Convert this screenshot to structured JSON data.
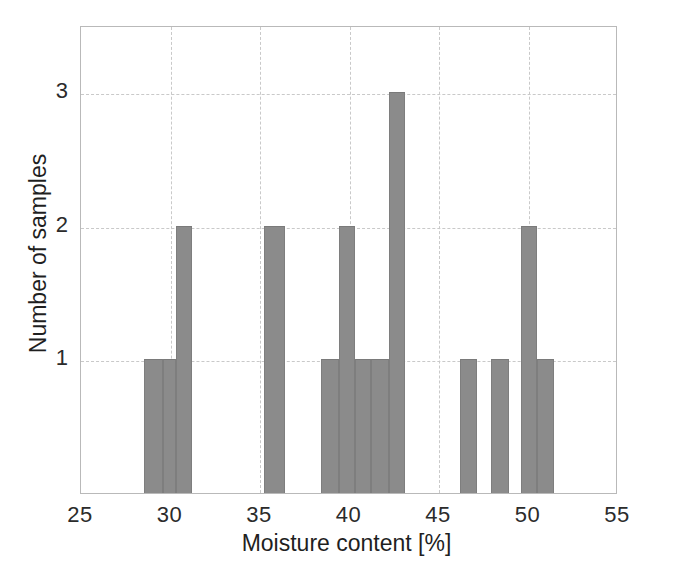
{
  "chart_data": {
    "type": "bar",
    "title": "",
    "subtitle": "",
    "xlabel": "Moisture content [%]",
    "ylabel": "Number of samples",
    "xlim": [
      25,
      55
    ],
    "ylim": [
      0,
      3.5
    ],
    "xticks": [
      25,
      30,
      35,
      40,
      45,
      50,
      55
    ],
    "xticklabels": [
      "25",
      "30",
      "35",
      "40",
      "45",
      "50",
      "55"
    ],
    "yticks": [
      1,
      2,
      3
    ],
    "yticklabels": [
      "1",
      "2",
      "3"
    ],
    "grid": "dashed-both-axes",
    "legend": "none",
    "bar_color": "#8b8b8b",
    "bin_width": 1.0,
    "bins": [
      {
        "x0": 28.5,
        "x1": 29.6,
        "count": 1
      },
      {
        "x0": 29.6,
        "x1": 30.3,
        "count": 1
      },
      {
        "x0": 30.3,
        "x1": 31.2,
        "count": 2
      },
      {
        "x0": 35.2,
        "x1": 36.4,
        "count": 2
      },
      {
        "x0": 38.4,
        "x1": 39.4,
        "count": 1
      },
      {
        "x0": 39.4,
        "x1": 40.3,
        "count": 2
      },
      {
        "x0": 40.3,
        "x1": 41.2,
        "count": 1
      },
      {
        "x0": 41.2,
        "x1": 42.2,
        "count": 1
      },
      {
        "x0": 42.2,
        "x1": 43.1,
        "count": 3
      },
      {
        "x0": 46.2,
        "x1": 47.1,
        "count": 1
      },
      {
        "x0": 47.9,
        "x1": 48.9,
        "count": 1
      },
      {
        "x0": 49.6,
        "x1": 50.5,
        "count": 2
      },
      {
        "x0": 50.5,
        "x1": 51.4,
        "count": 1
      }
    ],
    "categories": [
      "28.5-29.6",
      "29.6-30.3",
      "30.3-31.2",
      "35.2-36.4",
      "38.4-39.4",
      "39.4-40.3",
      "40.3-41.2",
      "41.2-42.2",
      "42.2-43.1",
      "46.2-47.1",
      "47.9-48.9",
      "49.6-50.5",
      "50.5-51.4"
    ],
    "values": [
      1,
      1,
      2,
      2,
      1,
      2,
      1,
      1,
      3,
      1,
      1,
      2,
      1
    ],
    "total_samples": 19
  }
}
